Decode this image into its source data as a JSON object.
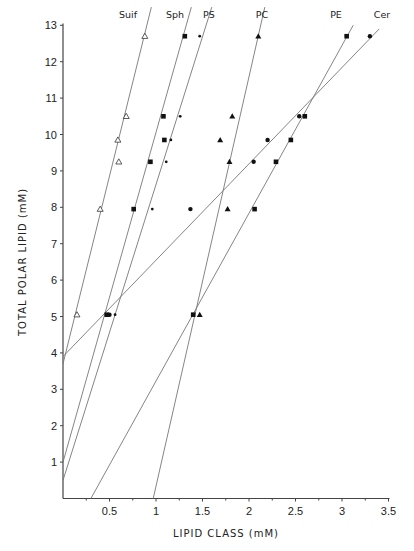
{
  "chart_data": {
    "type": "scatter",
    "title": "",
    "xlabel": "LIPID CLASS (mM)",
    "ylabel": "TOTAL POLAR LIPID (mM)",
    "xlim": [
      0,
      3.5
    ],
    "ylim": [
      0,
      13
    ],
    "x_ticks": [
      "0.5",
      "1",
      "1.5",
      "2",
      "2.5",
      "3",
      "3.5"
    ],
    "y_ticks": [
      "1",
      "2",
      "3",
      "4",
      "5",
      "6",
      "7",
      "8",
      "9",
      "10",
      "11",
      "12",
      "13"
    ],
    "grid": false,
    "legend_position": "inline labels at top of each regression line",
    "series": [
      {
        "name": "Suif",
        "marker": "open-triangle",
        "points": [
          [
            0.15,
            5.05
          ],
          [
            0.4,
            7.95
          ],
          [
            0.6,
            9.25
          ],
          [
            0.59,
            9.85
          ],
          [
            0.68,
            10.5
          ],
          [
            0.88,
            12.7
          ]
        ],
        "fit_line": {
          "x0": 0.0,
          "y0": 3.7,
          "x1": 0.95,
          "y1": 13.5
        }
      },
      {
        "name": "Sph",
        "marker": "filled-square",
        "points": [
          [
            0.47,
            5.05
          ],
          [
            0.76,
            7.95
          ],
          [
            0.94,
            9.25
          ],
          [
            1.09,
            9.85
          ],
          [
            1.08,
            10.5
          ],
          [
            1.31,
            12.7
          ]
        ],
        "fit_line": {
          "x0": 0.0,
          "y0": 1.0,
          "x1": 1.38,
          "y1": 13.5
        }
      },
      {
        "name": "PS",
        "marker": "small-star",
        "points": [
          [
            0.56,
            5.05
          ],
          [
            0.96,
            7.95
          ],
          [
            1.11,
            9.25
          ],
          [
            1.16,
            9.85
          ],
          [
            1.26,
            10.5
          ],
          [
            1.47,
            12.7
          ]
        ],
        "fit_line": {
          "x0": 0.0,
          "y0": 0.5,
          "x1": 1.6,
          "y1": 13.5
        }
      },
      {
        "name": "PC",
        "marker": "filled-triangle",
        "points": [
          [
            1.47,
            5.05
          ],
          [
            1.77,
            7.95
          ],
          [
            1.79,
            9.25
          ],
          [
            1.69,
            9.85
          ],
          [
            1.82,
            10.5
          ],
          [
            2.1,
            12.7
          ]
        ],
        "fit_line": {
          "x0": 0.97,
          "y0": 0.0,
          "x1": 2.17,
          "y1": 13.5
        }
      },
      {
        "name": "PE",
        "marker": "filled-square",
        "points": [
          [
            1.4,
            5.05
          ],
          [
            2.06,
            7.95
          ],
          [
            2.29,
            9.25
          ],
          [
            2.45,
            9.85
          ],
          [
            2.6,
            10.5
          ],
          [
            3.05,
            12.7
          ]
        ],
        "fit_line": {
          "x0": 0.3,
          "y0": 0.0,
          "x1": 3.12,
          "y1": 13.0
        }
      },
      {
        "name": "Cer",
        "marker": "filled-dot",
        "points": [
          [
            0.5,
            5.05
          ],
          [
            1.37,
            7.95
          ],
          [
            2.05,
            9.25
          ],
          [
            2.2,
            9.85
          ],
          [
            2.54,
            10.5
          ],
          [
            3.3,
            12.7
          ]
        ],
        "fit_line": {
          "x0": 0.0,
          "y0": 3.9,
          "x1": 3.4,
          "y1": 12.9
        }
      }
    ]
  }
}
